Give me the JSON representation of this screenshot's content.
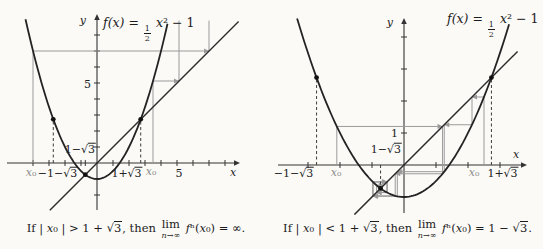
{
  "figure": {
    "kind": "textbook-cobweb-figure",
    "background": "#fbfaf7"
  },
  "colors": {
    "curve": "#232323",
    "diagonal": "#2b2b2b",
    "axis": "#333333",
    "cobweb": "#9a9a9a",
    "dashed": "#3d3d3d",
    "dot": "#111111",
    "label": "#222222",
    "gray_label": "#8b8b8b"
  },
  "chart_data": [
    {
      "type": "line",
      "panel": "left",
      "function_label": "f(x) = (1/2)x² − 1",
      "function": {
        "a": 0.5,
        "c": -1
      },
      "identity_line": "y = x",
      "fixed_points": [
        [
          -0.7320508,
          -0.7320508
        ],
        [
          2.7320508,
          2.7320508
        ]
      ],
      "origin_px": [
        97,
        163
      ],
      "unit_px": 16,
      "svg_w": 272,
      "svg_h": 215,
      "x_axis": {
        "from_px": 7,
        "to_px": 240
      },
      "y_axis": {
        "from_px": 210,
        "to_px": 14
      },
      "x_ticks": {
        "from": -4,
        "to": 8,
        "extra": [
          -0.7320508
        ]
      },
      "y_ticks": {
        "from": -2,
        "to": 8
      },
      "parab_range": [
        -4.47,
        4.47
      ],
      "diag_range": [
        -2.95,
        8.85
      ],
      "y_clip_top": 8.9,
      "cobwebs": [
        {
          "x0": -4,
          "steps": 3
        },
        {
          "x0": 3.5,
          "steps": 3
        }
      ],
      "dashed_guides": [
        -2.7320508,
        2.7320508
      ],
      "marked_points": [
        [
          -2.7320508,
          2.7320508
        ],
        [
          2.7320508,
          2.7320508
        ],
        [
          -0.7320508,
          -0.7320508
        ]
      ],
      "title": {
        "x": 103,
        "y": 30,
        "parts": [
          {
            "t": "f(x) = ",
            "i": 1
          },
          {
            "frac": [
              "1",
              "2"
            ]
          },
          {
            "t": " x",
            "i": 1
          },
          {
            "t": "²"
          },
          {
            "t": " − 1"
          }
        ]
      },
      "labels": [
        {
          "t": "y",
          "x": 86,
          "y": 20,
          "a": "end",
          "i": true
        },
        {
          "t": "5",
          "x": 91,
          "y": 84,
          "a": "end"
        },
        {
          "t": "1−√3",
          "x": 96,
          "y": 149,
          "a": "end"
        },
        {
          "t": "x₀",
          "x": 31,
          "y": 172,
          "gray": true
        },
        {
          "t": "−1−√3",
          "x": 58,
          "y": 173
        },
        {
          "t": "1+√3",
          "x": 127,
          "y": 173
        },
        {
          "t": "x₀",
          "x": 151,
          "y": 171,
          "gray": true
        },
        {
          "t": "5",
          "x": 179,
          "y": 173
        },
        {
          "t": "x",
          "x": 233,
          "y": 172,
          "i": true
        }
      ],
      "caption": {
        "pre": "If | x₀ | > 1 + √3, then ",
        "lim": "lim",
        "limsub": "n→∞",
        "post": " fⁿ(x₀) = ∞."
      }
    },
    {
      "type": "line",
      "panel": "right",
      "function_label": "f(x) = (1/2)x² − 1",
      "function": {
        "a": 0.5,
        "c": -1
      },
      "identity_line": "y = x",
      "fixed_points": [
        [
          -0.7320508,
          -0.7320508
        ],
        [
          2.7320508,
          2.7320508
        ]
      ],
      "origin_px": [
        132,
        165
      ],
      "unit_px": 32,
      "svg_w": 271,
      "svg_h": 215,
      "x_axis": {
        "from_px": 6,
        "to_px": 255
      },
      "y_axis": {
        "from_px": 213,
        "to_px": 18
      },
      "x_ticks": {
        "from": -3,
        "to": 3,
        "extra": []
      },
      "y_ticks": {
        "from": 1,
        "to": 4
      },
      "parab_range": [
        -3.34,
        3.34
      ],
      "diag_range": [
        -1.55,
        3.55
      ],
      "y_clip_top": 4.5,
      "cobwebs": [
        {
          "x0": -2.1,
          "steps": 6
        },
        {
          "x0": 2.5,
          "steps": 6
        }
      ],
      "dashed_guides": [
        -2.7320508,
        2.7320508,
        -0.7320508
      ],
      "marked_points": [
        [
          -2.7320508,
          2.7320508
        ],
        [
          2.7320508,
          2.7320508
        ],
        [
          -0.7320508,
          -0.7320508
        ]
      ],
      "title": {
        "x": 175,
        "y": 26,
        "parts": [
          {
            "t": "f(x) = ",
            "i": 1
          },
          {
            "frac": [
              "1",
              "2"
            ]
          },
          {
            "t": " x",
            "i": 1
          },
          {
            "t": "²"
          },
          {
            "t": " − 1"
          }
        ]
      },
      "labels": [
        {
          "t": "y",
          "x": 121,
          "y": 22,
          "a": "end",
          "i": true
        },
        {
          "t": "1",
          "x": 126,
          "y": 133,
          "a": "end"
        },
        {
          "t": "1−√3",
          "x": 130,
          "y": 149,
          "a": "end"
        },
        {
          "t": "−1−√3",
          "x": 22,
          "y": 173
        },
        {
          "t": "x₀",
          "x": 64,
          "y": 172,
          "gray": true
        },
        {
          "t": "x₀",
          "x": 202,
          "y": 172,
          "gray": true
        },
        {
          "t": "1+√3",
          "x": 231,
          "y": 173
        },
        {
          "t": "x",
          "x": 244,
          "y": 154,
          "i": true
        }
      ],
      "caption": {
        "pre": "If | x₀ | < 1 + √3, then ",
        "lim": "lim",
        "limsub": "n→∞",
        "post": " fⁿ(x₀) = 1 − √3."
      }
    }
  ]
}
